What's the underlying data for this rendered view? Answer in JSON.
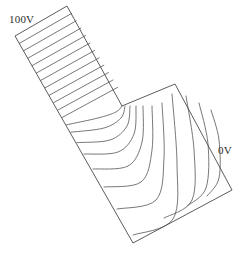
{
  "figure": {
    "background_color": "#ffffff",
    "outline_color": "#4a4a4a",
    "equipotential_color": "#555555",
    "label_color": "#2b2b2b",
    "width": 246,
    "height": 258
  },
  "labels": {
    "high_potential": "100V",
    "low_potential": "0V"
  },
  "chart_data": {
    "type": "line",
    "xlabel": "",
    "ylabel": "",
    "xlim": [
      0,
      246
    ],
    "ylim": [
      0,
      258
    ],
    "grid": false,
    "legend_position": "none",
    "annotations": [
      {
        "text": "100V",
        "x": 9,
        "y": 13,
        "describes": "upper-left electrode end of strip"
      },
      {
        "text": "0V",
        "x": 218,
        "y": 144,
        "describes": "lower-right electrode end of strip"
      }
    ],
    "domain_outline": {
      "name": "strip-boundary",
      "closed": true,
      "vertices": [
        [
          15,
          36
        ],
        [
          67,
          6
        ],
        [
          122,
          106
        ],
        [
          175,
          84
        ],
        [
          232,
          190
        ],
        [
          133,
          243
        ]
      ]
    },
    "electrodes": [
      {
        "name": "high-potential-electrode",
        "value": 100,
        "unit": "V",
        "from": [
          15,
          36
        ],
        "to": [
          67,
          6
        ]
      },
      {
        "name": "low-potential-electrode",
        "value": 0,
        "unit": "V",
        "from": [
          175,
          84
        ],
        "to": [
          232,
          190
        ]
      }
    ],
    "series": [
      {
        "name": "equipotential-01",
        "value": 95,
        "points": [
          [
            19.3,
            43.4
          ],
          [
            71.6,
            13.4
          ]
        ]
      },
      {
        "name": "equipotential-02",
        "value": 90,
        "points": [
          [
            23.6,
            50.8
          ],
          [
            76.2,
            20.8
          ]
        ]
      },
      {
        "name": "equipotential-03",
        "value": 85,
        "points": [
          [
            27.9,
            58.2
          ],
          [
            80.8,
            28.2
          ]
        ]
      },
      {
        "name": "equipotential-04",
        "value": 80,
        "points": [
          [
            32.2,
            65.6
          ],
          [
            85.4,
            35.6
          ]
        ]
      },
      {
        "name": "equipotential-05",
        "value": 75,
        "points": [
          [
            36.5,
            73.0
          ],
          [
            90.0,
            43.0
          ]
        ]
      },
      {
        "name": "equipotential-06",
        "value": 70,
        "points": [
          [
            40.8,
            80.4
          ],
          [
            94.6,
            50.4
          ]
        ]
      },
      {
        "name": "equipotential-07",
        "value": 65,
        "points": [
          [
            45.1,
            87.8
          ],
          [
            99.2,
            57.8
          ]
        ]
      },
      {
        "name": "equipotential-08",
        "value": 60,
        "points": [
          [
            49.4,
            95.2
          ],
          [
            103.8,
            65.2
          ]
        ]
      },
      {
        "name": "equipotential-09",
        "value": 55,
        "points": [
          [
            53.7,
            102.6
          ],
          [
            108.4,
            72.6
          ]
        ]
      },
      {
        "name": "equipotential-10",
        "value": 50,
        "points": [
          [
            58.0,
            110.0
          ],
          [
            113.0,
            80.0
          ]
        ]
      },
      {
        "name": "equipotential-11",
        "value": 47,
        "points": [
          [
            62.3,
            117.4
          ],
          [
            117.6,
            87.4
          ]
        ]
      },
      {
        "name": "equipotential-12",
        "value": 44,
        "curve": true,
        "points": [
          [
            66.6,
            124.8
          ],
          [
            98.0,
            118.0
          ],
          [
            116.0,
            112.0
          ],
          [
            122.0,
            106.0
          ]
        ]
      },
      {
        "name": "equipotential-13",
        "value": 41,
        "curve": true,
        "points": [
          [
            71.0,
            132.2
          ],
          [
            104.0,
            128.0
          ],
          [
            121.0,
            118.0
          ],
          [
            125.0,
            106.0
          ]
        ]
      },
      {
        "name": "equipotential-14",
        "value": 38,
        "curve": true,
        "points": [
          [
            77.0,
            142.6
          ],
          [
            110.0,
            140.0
          ],
          [
            127.0,
            126.0
          ],
          [
            130.0,
            106.0
          ]
        ]
      },
      {
        "name": "equipotential-15",
        "value": 34,
        "curve": true,
        "points": [
          [
            84.0,
            154.0
          ],
          [
            118.0,
            152.0
          ],
          [
            134.0,
            134.0
          ],
          [
            136.0,
            106.0
          ]
        ]
      },
      {
        "name": "equipotential-16",
        "value": 30,
        "curve": true,
        "points": [
          [
            93.0,
            169.0
          ],
          [
            128.0,
            166.0
          ],
          [
            142.0,
            142.0
          ],
          [
            143.0,
            106.0
          ]
        ]
      },
      {
        "name": "equipotential-17",
        "value": 25,
        "curve": true,
        "points": [
          [
            104.0,
            187.0
          ],
          [
            141.0,
            182.0
          ],
          [
            152.0,
            150.0
          ],
          [
            152.0,
            106.0
          ]
        ]
      },
      {
        "name": "equipotential-18",
        "value": 20,
        "curve": true,
        "points": [
          [
            117.0,
            209.0
          ],
          [
            156.0,
            200.0
          ],
          [
            164.0,
            158.0
          ],
          [
            162.0,
            103.0
          ]
        ]
      },
      {
        "name": "equipotential-19",
        "value": 14,
        "curve": true,
        "points": [
          [
            133.0,
            235.0
          ],
          [
            173.0,
            219.0
          ],
          [
            177.0,
            164.0
          ],
          [
            172.0,
            94.0
          ]
        ]
      },
      {
        "name": "equipotential-20",
        "value": 9,
        "curve": true,
        "points": [
          [
            164.0,
            218.0
          ],
          [
            192.0,
            200.0
          ],
          [
            194.0,
            150.0
          ],
          [
            186.0,
            96.0
          ]
        ]
      },
      {
        "name": "equipotential-21",
        "value": 5,
        "curve": true,
        "points": [
          [
            187.0,
            206.0
          ],
          [
            206.0,
            188.0
          ],
          [
            208.0,
            144.0
          ],
          [
            199.0,
            103.0
          ]
        ]
      },
      {
        "name": "equipotential-22",
        "value": 2,
        "curve": true,
        "points": [
          [
            207.0,
            196.0
          ],
          [
            219.0,
            178.0
          ],
          [
            219.0,
            140.0
          ],
          [
            211.0,
            110.0
          ]
        ]
      }
    ]
  }
}
